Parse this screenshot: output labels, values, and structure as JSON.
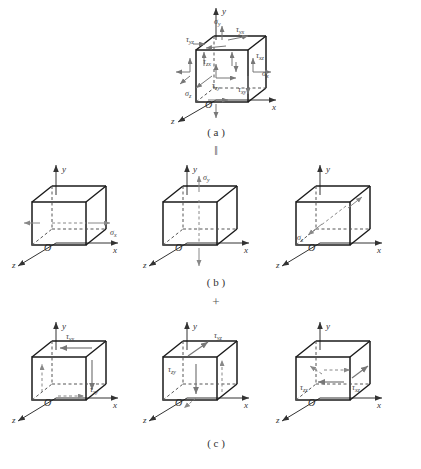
{
  "figure": {
    "colors": {
      "edge_solid": "#1a1a1a",
      "edge_hidden": "#555555",
      "axis": "#333333",
      "arrow_stress": "#777777",
      "label": "#444444",
      "background": "#ffffff"
    },
    "captions": [
      {
        "id": "a",
        "text": "( a )"
      },
      {
        "id": "b",
        "text": "( b )"
      },
      {
        "id": "c",
        "text": "( c )"
      }
    ],
    "operators": [
      {
        "id": "equals",
        "text": "‖"
      },
      {
        "id": "plus",
        "text": "+"
      }
    ],
    "axes": {
      "x_label": "x",
      "y_label": "y",
      "z_label": "z",
      "origin_label": "O"
    }
  },
  "panels": {
    "a": {
      "caption": "( a )",
      "description": "General triaxial stress state with all normal and shear stress components",
      "labels": [
        {
          "name": "sigma-y",
          "text": "σ",
          "sub": "y"
        },
        {
          "name": "tau-yx",
          "text": "τ",
          "sub": "yx"
        },
        {
          "name": "tau-yz",
          "text": "τ",
          "sub": "yz"
        },
        {
          "name": "tau-xz",
          "text": "τ",
          "sub": "xz"
        },
        {
          "name": "sigma-x",
          "text": "σ",
          "sub": "x"
        },
        {
          "name": "tau-xy",
          "text": "τ",
          "sub": "xy"
        },
        {
          "name": "sigma-z",
          "text": "σ",
          "sub": "z"
        },
        {
          "name": "tau-zy",
          "text": "τ",
          "sub": "zy"
        },
        {
          "name": "tau-zx",
          "text": "τ",
          "sub": "zx"
        }
      ]
    },
    "b": {
      "caption": "( b )",
      "description": "Normal stress components shown separately on three cubes",
      "cubes": [
        {
          "name": "normal-stress-x",
          "label": "σ",
          "sub": "x",
          "axis": "x"
        },
        {
          "name": "normal-stress-y",
          "label": "σ",
          "sub": "y",
          "axis": "y"
        },
        {
          "name": "normal-stress-z",
          "label": "σ",
          "sub": "z",
          "axis": "z"
        }
      ]
    },
    "c": {
      "caption": "( c )",
      "description": "Shear stress component pairs shown separately on three cubes",
      "cubes": [
        {
          "name": "shear-stress-xy",
          "label1": "τ",
          "sub1": "yx",
          "label2": "τ",
          "sub2": "xy"
        },
        {
          "name": "shear-stress-yz",
          "label1": "τ",
          "sub1": "yz",
          "label2": "τ",
          "sub2": "zy"
        },
        {
          "name": "shear-stress-zx",
          "label1": "τ",
          "sub1": "zx",
          "label2": "τ",
          "sub2": "xz"
        }
      ]
    }
  }
}
